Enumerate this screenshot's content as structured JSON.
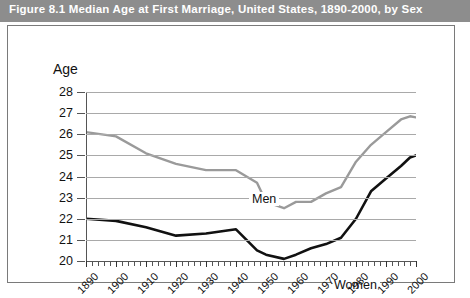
{
  "figure": {
    "title": "Figure 8.1   Median Age at First Marriage, United States, 1890-2000, by Sex",
    "title_bar_color": "#8d8d8d",
    "title_text_color": "#ffffff"
  },
  "chart_data": {
    "type": "line",
    "title": "Median Age at First Marriage, United States, 1890-2000, by Sex",
    "xlabel": "",
    "ylabel": "Age",
    "ylim": [
      20,
      28
    ],
    "xlim": [
      1890,
      2000
    ],
    "grid": true,
    "legend": "inline-labels",
    "yticks": [
      20,
      21,
      22,
      23,
      24,
      25,
      26,
      27,
      28
    ],
    "xticks": [
      1890,
      1900,
      1910,
      1920,
      1930,
      1940,
      1950,
      1960,
      1970,
      1980,
      1990,
      2000
    ],
    "x": [
      1890,
      1900,
      1910,
      1920,
      1930,
      1940,
      1947,
      1950,
      1956,
      1960,
      1965,
      1970,
      1975,
      1980,
      1985,
      1990,
      1995,
      1998,
      2000
    ],
    "series": [
      {
        "name": "Men",
        "color": "#9a9a9a",
        "values": [
          26.1,
          25.9,
          25.1,
          24.6,
          24.3,
          24.3,
          23.7,
          22.8,
          22.5,
          22.8,
          22.8,
          23.2,
          23.5,
          24.7,
          25.5,
          26.1,
          26.7,
          26.85,
          26.8
        ]
      },
      {
        "name": "Women",
        "color": "#111111",
        "values": [
          22.0,
          21.9,
          21.6,
          21.2,
          21.3,
          21.5,
          20.5,
          20.3,
          20.1,
          20.3,
          20.6,
          20.8,
          21.1,
          22.0,
          23.3,
          23.9,
          24.5,
          24.9,
          25.0
        ]
      }
    ],
    "annotations": [
      {
        "text": "Men",
        "x": 1925,
        "y": 25.4
      },
      {
        "text": "Women",
        "x": 1953,
        "y": 21.8
      }
    ]
  },
  "axis": {
    "y_title": "Age",
    "y_tick_labels": [
      "28",
      "27",
      "26",
      "25",
      "24",
      "23",
      "22",
      "21",
      "20"
    ],
    "x_tick_labels": [
      "1890",
      "1900",
      "1910",
      "1920",
      "1930",
      "1940",
      "1950",
      "1960",
      "1970",
      "1980",
      "1990",
      "2000"
    ]
  }
}
